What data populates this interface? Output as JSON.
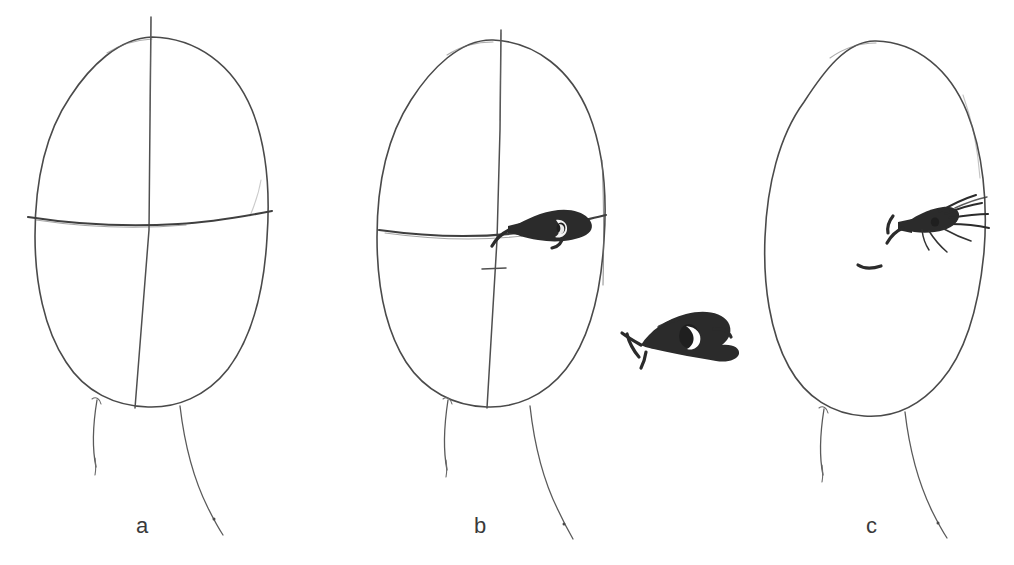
{
  "figure": {
    "kind": "hand-drawn-pencil-sketch",
    "background_color": "#ffffff",
    "pencil_color": "#4a4a4a",
    "ink_color": "#2b2b2b",
    "panel_count": 3
  },
  "panels": [
    {
      "id": "a",
      "label": "a",
      "description": "Egg-shaped head outline with vertical centerline and horizontal eye line, plus neck lines",
      "features": [
        "head-outline",
        "vertical-centerline",
        "horizontal-eye-line",
        "neck-left-line",
        "neck-right-line"
      ]
    },
    {
      "id": "b",
      "label": "b",
      "description": "Same construction with one dark almond eye placed on the eye line and a short nose tick on the centerline",
      "features": [
        "head-outline",
        "vertical-centerline",
        "horizontal-eye-line",
        "nose-tick-mark",
        "eye-shape",
        "neck-left-line",
        "neck-right-line"
      ]
    },
    {
      "id": "c",
      "label": "c",
      "description": "Finished head without construction lines, eye with radiating eyelashes and a small nose stroke",
      "features": [
        "head-outline",
        "eye-with-lashes",
        "nose-stroke",
        "neck-left-line",
        "neck-right-line"
      ]
    }
  ],
  "detail": {
    "id": "eye-detail",
    "label": "",
    "description": "Enlarged inked study of the eye: heavy almond outline with a crescent pupil, pointed inner corner at left"
  },
  "labels": {
    "a": "a",
    "b": "b",
    "c": "c"
  }
}
